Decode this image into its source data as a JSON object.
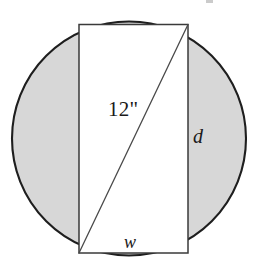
{
  "figure": {
    "kind": "geometry-diagram",
    "labels": {
      "diagonal": "12\"",
      "height": "d",
      "width": "w"
    },
    "colors": {
      "page_background": "#ffffff",
      "circle_fill": "#d7d7d7",
      "circle_stroke": "#1e1e1e",
      "rectangle_fill": "#ffffff",
      "rectangle_stroke": "#3a3a3a",
      "diagonal_stroke": "#4a4a4a",
      "label_text": "#1a1a1a"
    },
    "geometry": {
      "circle": {
        "cx": 129,
        "cy": 138.5,
        "r": 118,
        "stroke_width": 2.1
      },
      "rectangle": {
        "x": 79,
        "y": 24.5,
        "width": 109,
        "height": 228.5,
        "stroke_width": 1.5
      },
      "diagonal": {
        "x1": 188,
        "y1": 24.5,
        "x2": 79,
        "y2": 253,
        "stroke_width": 1.3
      }
    }
  },
  "chart_data": {
    "type": "diagram",
    "title": "",
    "shapes": [
      {
        "name": "circle",
        "role": "outer-shaded-region",
        "center": [
          129,
          138.5
        ],
        "radius": 118,
        "fill": "#d7d7d7",
        "stroke": "#1e1e1e"
      },
      {
        "name": "rectangle",
        "role": "inscribed-white-rectangle",
        "corners": [
          [
            79,
            24.5
          ],
          [
            188,
            24.5
          ],
          [
            188,
            253
          ],
          [
            79,
            253
          ]
        ],
        "fill": "#ffffff",
        "stroke": "#3a3a3a",
        "labeled_sides": {
          "right": "d",
          "bottom": "w"
        }
      },
      {
        "name": "diagonal",
        "role": "rectangle-diagonal",
        "from": [
          188,
          24.5
        ],
        "to": [
          79,
          253
        ],
        "label": "12\"",
        "stroke": "#4a4a4a"
      }
    ],
    "annotations": [
      {
        "text": "12\"",
        "x": 108,
        "y": 99,
        "style": "serif-upright",
        "refers_to": "diagonal"
      },
      {
        "text": "d",
        "x": 193,
        "y": 126,
        "style": "serif-italic",
        "refers_to": "rectangle-right-side"
      },
      {
        "text": "w",
        "x": 124,
        "y": 233,
        "style": "serif-italic",
        "refers_to": "rectangle-bottom-side"
      }
    ]
  }
}
